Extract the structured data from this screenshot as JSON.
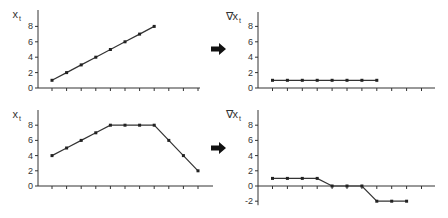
{
  "figure": {
    "panels": [
      {
        "id": "top-left",
        "ylabel": "x",
        "ylabel_sub": "t"
      },
      {
        "id": "top-right",
        "ylabel": "∇x",
        "ylabel_sub": "t"
      },
      {
        "id": "bottom-left",
        "ylabel": "x",
        "ylabel_sub": "t"
      },
      {
        "id": "bottom-right",
        "ylabel": "∇x",
        "ylabel_sub": "t"
      }
    ],
    "arrow_icon": "right-arrow-icon"
  },
  "chart_data": [
    {
      "type": "line",
      "title": "",
      "ylabel": "x_t",
      "xlabel": "",
      "x": [
        1,
        2,
        3,
        4,
        5,
        6,
        7,
        8
      ],
      "values": [
        1,
        2,
        3,
        4,
        5,
        6,
        7,
        8
      ],
      "yticks": [
        0,
        2,
        4,
        6,
        8
      ],
      "xticks_count": 11,
      "ylim": [
        0,
        9
      ]
    },
    {
      "type": "line",
      "title": "",
      "ylabel": "∇x_t",
      "xlabel": "",
      "x": [
        1,
        2,
        3,
        4,
        5,
        6,
        7,
        8
      ],
      "values": [
        1,
        1,
        1,
        1,
        1,
        1,
        1,
        1
      ],
      "yticks": [
        0,
        2,
        4,
        6,
        8
      ],
      "xticks_count": 11,
      "ylim": [
        0,
        9
      ]
    },
    {
      "type": "line",
      "title": "",
      "ylabel": "x_t",
      "xlabel": "",
      "x": [
        1,
        2,
        3,
        4,
        5,
        6,
        7,
        8,
        9,
        10,
        11
      ],
      "values": [
        4,
        5,
        6,
        7,
        8,
        8,
        8,
        8,
        6,
        4,
        2
      ],
      "yticks": [
        0,
        2,
        4,
        6,
        8
      ],
      "xticks_count": 11,
      "ylim": [
        0,
        9
      ]
    },
    {
      "type": "line",
      "title": "",
      "ylabel": "∇x_t",
      "xlabel": "",
      "x": [
        1,
        2,
        3,
        4,
        5,
        6,
        7,
        8,
        9,
        10
      ],
      "values": [
        1,
        1,
        1,
        1,
        0,
        0,
        0,
        -2,
        -2,
        -2
      ],
      "yticks": [
        -2,
        0,
        2,
        4,
        6,
        8
      ],
      "xticks_count": 11,
      "ylim": [
        -2.5,
        9
      ]
    }
  ]
}
